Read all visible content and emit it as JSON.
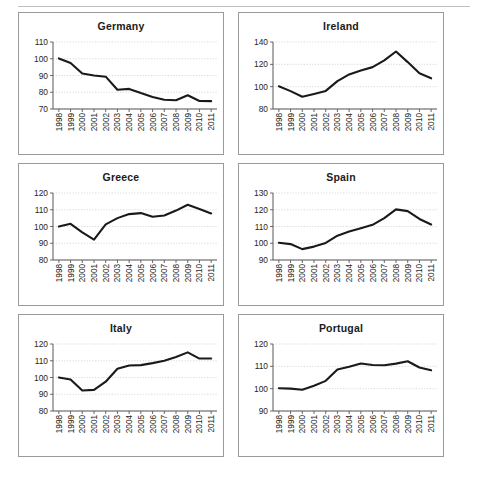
{
  "figure": {
    "panel_count": 6,
    "x_tick_labels": [
      "1998",
      "1999",
      "2000",
      "2001",
      "2002",
      "2003",
      "2004",
      "2005",
      "2006",
      "2007",
      "2008",
      "2009",
      "2010",
      "2011"
    ],
    "series_color": "#1a1a1a",
    "grid_color": "#c9c9c9",
    "border_color": "#9a9a9a",
    "caption": ""
  },
  "chart_data": [
    {
      "type": "line",
      "title": "Germany",
      "xlabel": "",
      "ylabel": "",
      "categories": [
        "1998",
        "1999",
        "2000",
        "2001",
        "2002",
        "2003",
        "2004",
        "2005",
        "2006",
        "2007",
        "2008",
        "2009",
        "2010",
        "2011"
      ],
      "values": [
        100.2,
        97.5,
        91.2,
        90.0,
        89.3,
        81.5,
        82.0,
        79.5,
        77.2,
        75.5,
        75.2,
        78.2,
        74.8,
        74.7
      ],
      "ylim": [
        70,
        110
      ],
      "yticks": [
        70,
        80,
        90,
        100,
        110
      ],
      "grid": true,
      "legend": "none"
    },
    {
      "type": "line",
      "title": "Ireland",
      "xlabel": "",
      "ylabel": "",
      "categories": [
        "1998",
        "1999",
        "2000",
        "2001",
        "2002",
        "2003",
        "2004",
        "2005",
        "2006",
        "2007",
        "2008",
        "2009",
        "2010",
        "2011"
      ],
      "values": [
        100.3,
        96.0,
        91.0,
        93.5,
        96.2,
        105.0,
        111.0,
        114.5,
        117.5,
        123.5,
        131.5,
        122.0,
        112.0,
        107.5
      ],
      "ylim": [
        80,
        140
      ],
      "yticks": [
        80,
        100,
        120,
        140
      ],
      "grid": true,
      "legend": "none"
    },
    {
      "type": "line",
      "title": "Greece",
      "xlabel": "",
      "ylabel": "",
      "categories": [
        "1998",
        "1999",
        "2000",
        "2001",
        "2002",
        "2003",
        "2004",
        "2005",
        "2006",
        "2007",
        "2008",
        "2009",
        "2010",
        "2011"
      ],
      "values": [
        100.0,
        101.6,
        96.5,
        92.2,
        101.3,
        105.0,
        107.4,
        108.0,
        105.8,
        106.6,
        109.5,
        113.0,
        110.5,
        107.8
      ],
      "ylim": [
        80,
        120
      ],
      "yticks": [
        80,
        90,
        100,
        110,
        120
      ],
      "grid": true,
      "legend": "none"
    },
    {
      "type": "line",
      "title": "Spain",
      "xlabel": "",
      "ylabel": "",
      "categories": [
        "1998",
        "1999",
        "2000",
        "2001",
        "2002",
        "2003",
        "2004",
        "2005",
        "2006",
        "2007",
        "2008",
        "2009",
        "2010",
        "2011"
      ],
      "values": [
        100.3,
        99.5,
        96.5,
        98.0,
        100.2,
        104.5,
        107.0,
        109.0,
        111.0,
        115.0,
        120.2,
        119.2,
        114.5,
        111.2
      ],
      "ylim": [
        90,
        130
      ],
      "yticks": [
        90,
        100,
        110,
        120,
        130
      ],
      "grid": true,
      "legend": "none"
    },
    {
      "type": "line",
      "title": "Italy",
      "xlabel": "",
      "ylabel": "",
      "categories": [
        "1998",
        "1999",
        "2000",
        "2001",
        "2002",
        "2003",
        "2004",
        "2005",
        "2006",
        "2007",
        "2008",
        "2009",
        "2010",
        "2011"
      ],
      "values": [
        100.0,
        98.8,
        92.2,
        92.6,
        97.5,
        105.2,
        107.2,
        107.4,
        108.6,
        110.0,
        112.2,
        115.0,
        111.3,
        111.3
      ],
      "ylim": [
        80,
        120
      ],
      "yticks": [
        80,
        90,
        100,
        110,
        120
      ],
      "grid": true,
      "legend": "none"
    },
    {
      "type": "line",
      "title": "Portugal",
      "xlabel": "",
      "ylabel": "",
      "categories": [
        "1998",
        "1999",
        "2000",
        "2001",
        "2002",
        "2003",
        "2004",
        "2005",
        "2006",
        "2007",
        "2008",
        "2009",
        "2010",
        "2011"
      ],
      "values": [
        100.2,
        100.0,
        99.5,
        101.3,
        103.5,
        108.6,
        109.8,
        111.3,
        110.6,
        110.5,
        111.2,
        112.3,
        109.5,
        108.2
      ],
      "ylim": [
        90,
        120
      ],
      "yticks": [
        90,
        100,
        110,
        120
      ],
      "grid": true,
      "legend": "none"
    }
  ]
}
